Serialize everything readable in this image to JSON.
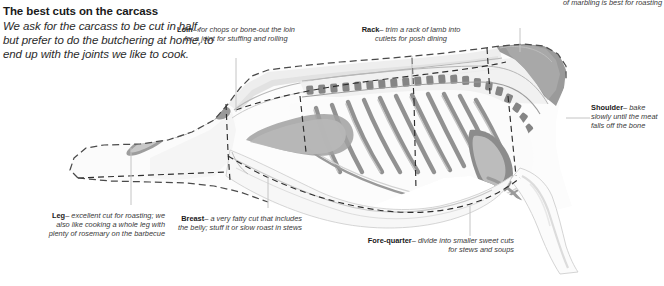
{
  "intro": {
    "title": "The best cuts on the carcass",
    "body": "We ask for the carcass to be cut in half, but prefer to do the butchering at home, to end up with the joints we like to cook."
  },
  "callouts": [
    {
      "id": "loin",
      "name": "Loin",
      "dash": "–",
      "text": "for chops or bone-out the loin for a joint for stuffing and rolling",
      "align": "center"
    },
    {
      "id": "rack",
      "name": "Rack",
      "dash": "–",
      "text": "trim a rack of lamb into cutlets for posh dining",
      "align": "center"
    },
    {
      "id": "neck",
      "name": "",
      "dash": "",
      "text": "of marbling is best for roasting",
      "align": "right"
    },
    {
      "id": "shoulder",
      "name": "Shoulder",
      "dash": "–",
      "text": "bake slowly until the meat falls off the bone",
      "align": "left"
    },
    {
      "id": "fore-quarter",
      "name": "Fore-quarter",
      "dash": "–",
      "text": "divide into smaller sweet cuts for stews and soups",
      "align": "right"
    },
    {
      "id": "breast",
      "name": "Breast",
      "dash": "–",
      "text": "a very fatty cut that includes the belly; stuff it or slow roast in stews",
      "align": "right"
    },
    {
      "id": "leg",
      "name": "Leg",
      "dash": "–",
      "text": "excellent cut for roasting; we also like cooking a whole leg with plenty of rosemary on the barbecue",
      "align": "right"
    }
  ],
  "diagram": {
    "colors": {
      "outline": "#3a3a3a",
      "bone_mid": "#8a8a8a",
      "bone_dark": "#6d6d6d",
      "flesh_light": "#f2f2f2",
      "flesh_mid": "#d9d9d9",
      "flesh_pale": "#fafafa",
      "leader": "#c9c9c9",
      "text": "#3a3a3a",
      "heading": "#1a1a1a"
    }
  }
}
